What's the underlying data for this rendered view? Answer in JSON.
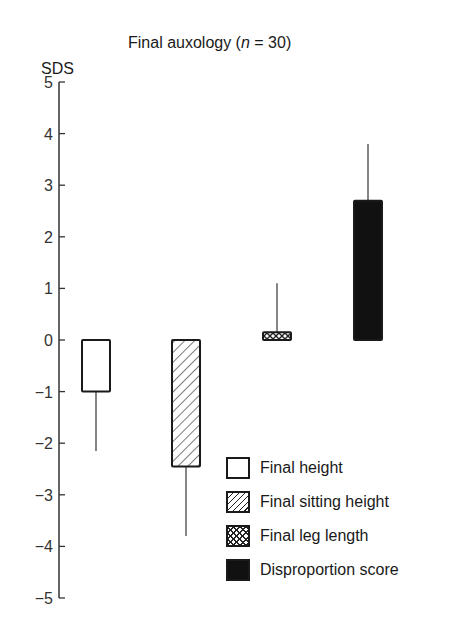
{
  "chart_data": {
    "type": "bar",
    "title": "Final auxology (n = 30)",
    "title_parts": {
      "prefix": "Final auxology (",
      "italic": "n",
      "suffix": " = 30)"
    },
    "xlabel": "",
    "ylabel": "SDS",
    "ylim": [
      -5,
      5
    ],
    "yticks": [
      5,
      4,
      3,
      2,
      1,
      0,
      -1,
      -2,
      -3,
      -4,
      -5
    ],
    "ytick_labels": [
      "5",
      "4",
      "3",
      "2",
      "1",
      "0",
      "−1",
      "−2",
      "−3",
      "−4",
      "−5"
    ],
    "grid": false,
    "legend_position": "lower right",
    "categories": [
      "Final height",
      "Final sitting height",
      "Final leg length",
      "Disproportion score"
    ],
    "values": [
      -1.0,
      -2.45,
      0.15,
      2.7
    ],
    "error_bar_ends": [
      -2.15,
      -3.8,
      1.1,
      3.8
    ],
    "fills": [
      "white",
      "diagonal-hatch",
      "cross-hatch",
      "black"
    ]
  },
  "legend": {
    "items": [
      {
        "label": "Final height",
        "fill": "white"
      },
      {
        "label": "Final sitting height",
        "fill": "diagonal-hatch"
      },
      {
        "label": "Final leg length",
        "fill": "cross-hatch"
      },
      {
        "label": "Disproportion score",
        "fill": "black"
      }
    ]
  }
}
